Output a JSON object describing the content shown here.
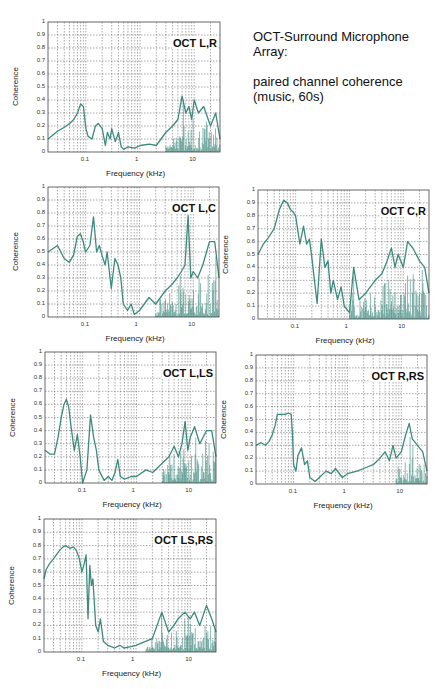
{
  "page": {
    "title_lines": [
      "OCT-Surround Microphone",
      "Array:"
    ],
    "subtitle_lines": [
      "paired channel coherence",
      "(music, 60s)"
    ],
    "page_number": ""
  },
  "colors": {
    "trace": "#3d8a7e",
    "grid": "#555555",
    "axis": "#444444"
  },
  "chart_data": [
    {
      "type": "line",
      "title": "OCT L,R",
      "xlabel": "Frequency (kHz)",
      "ylabel": "Coherence",
      "xscale": "log",
      "xlim": [
        0.02,
        30
      ],
      "ylim": [
        0,
        1
      ],
      "x_ticks": [
        "0.1",
        "1",
        "10"
      ],
      "y_ticks": [
        "0",
        "0.1",
        "0.2",
        "0.3",
        "0.4",
        "0.5",
        "0.6",
        "0.7",
        "0.8",
        "0.9",
        "1"
      ],
      "grid": true,
      "x": [
        0.02,
        0.03,
        0.04,
        0.05,
        0.06,
        0.07,
        0.08,
        0.09,
        0.1,
        0.11,
        0.13,
        0.15,
        0.17,
        0.2,
        0.23,
        0.25,
        0.28,
        0.3,
        0.35,
        0.4,
        0.45,
        0.5,
        0.6,
        0.8,
        1,
        1.5,
        2,
        3,
        4,
        5,
        6,
        7,
        8,
        9,
        10,
        12,
        15,
        20,
        25,
        30
      ],
      "y": [
        0.1,
        0.16,
        0.19,
        0.22,
        0.25,
        0.3,
        0.37,
        0.35,
        0.18,
        0.12,
        0.1,
        0.2,
        0.22,
        0.18,
        0.05,
        0.15,
        0.1,
        0.18,
        0.08,
        0.15,
        0.04,
        0.02,
        0.04,
        0.03,
        0.05,
        0.06,
        0.05,
        0.15,
        0.2,
        0.25,
        0.43,
        0.3,
        0.35,
        0.25,
        0.4,
        0.3,
        0.35,
        0.2,
        0.3,
        0.1
      ],
      "noise_floor": 0.05,
      "noise_band_from": 3
    },
    {
      "type": "line",
      "title": "OCT L,C",
      "xlabel": "Frequency (kHz)",
      "ylabel": "Coherence",
      "xscale": "log",
      "xlim": [
        0.02,
        30
      ],
      "ylim": [
        0,
        1
      ],
      "x_ticks": [
        "0.1",
        "1",
        "10"
      ],
      "y_ticks": [
        "0",
        "0.1",
        "0.2",
        "0.3",
        "0.4",
        "0.5",
        "0.6",
        "0.7",
        "0.8",
        "0.9",
        "1"
      ],
      "grid": true,
      "x": [
        0.02,
        0.03,
        0.04,
        0.05,
        0.06,
        0.07,
        0.08,
        0.09,
        0.1,
        0.12,
        0.14,
        0.16,
        0.18,
        0.2,
        0.23,
        0.25,
        0.3,
        0.35,
        0.4,
        0.45,
        0.5,
        0.6,
        0.7,
        0.8,
        1,
        1.5,
        2,
        3,
        4,
        5,
        6,
        7,
        8,
        9,
        10,
        12,
        15,
        20,
        25,
        30
      ],
      "y": [
        0.5,
        0.55,
        0.45,
        0.42,
        0.48,
        0.62,
        0.64,
        0.58,
        0.5,
        0.55,
        0.77,
        0.5,
        0.55,
        0.48,
        0.4,
        0.5,
        0.22,
        0.45,
        0.4,
        0.3,
        0.1,
        0.05,
        0.1,
        0.02,
        0.05,
        0.15,
        0.1,
        0.2,
        0.25,
        0.3,
        0.35,
        0.4,
        0.78,
        0.3,
        0.35,
        0.3,
        0.4,
        0.58,
        0.58,
        0.3
      ],
      "noise_floor": 0.08,
      "noise_band_from": 2
    },
    {
      "type": "line",
      "title": "OCT C,R",
      "xlabel": "Frequency (kHz)",
      "ylabel": "Coherence",
      "xscale": "log",
      "xlim": [
        0.02,
        30
      ],
      "ylim": [
        0,
        1
      ],
      "x_ticks": [
        "0.1",
        "1",
        "10"
      ],
      "y_ticks": [
        "0",
        "0.1",
        "0.2",
        "0.3",
        "0.4",
        "0.5",
        "0.6",
        "0.7",
        "0.8",
        "0.9",
        "1"
      ],
      "grid": true,
      "x": [
        0.02,
        0.025,
        0.03,
        0.04,
        0.05,
        0.06,
        0.07,
        0.08,
        0.09,
        0.1,
        0.12,
        0.14,
        0.16,
        0.18,
        0.2,
        0.25,
        0.3,
        0.35,
        0.4,
        0.45,
        0.5,
        0.6,
        0.7,
        0.8,
        1,
        1.2,
        1.5,
        2,
        3,
        4,
        5,
        6,
        7,
        8,
        9,
        10,
        12,
        15,
        20,
        25,
        30
      ],
      "y": [
        0.5,
        0.58,
        0.62,
        0.7,
        0.85,
        0.92,
        0.9,
        0.85,
        0.83,
        0.8,
        0.58,
        0.72,
        0.58,
        0.62,
        0.48,
        0.12,
        0.62,
        0.4,
        0.45,
        0.2,
        0.3,
        0.15,
        0.25,
        0.1,
        0.05,
        0.4,
        0.15,
        0.2,
        0.3,
        0.35,
        0.45,
        0.55,
        0.4,
        0.5,
        0.45,
        0.4,
        0.6,
        0.55,
        0.45,
        0.4,
        0.2
      ],
      "noise_floor": 0.08,
      "noise_band_from": 1
    },
    {
      "type": "line",
      "title": "OCT L,LS",
      "xlabel": "Frequency (kHz)",
      "ylabel": "Coherence",
      "xscale": "log",
      "xlim": [
        0.02,
        30
      ],
      "ylim": [
        0,
        1
      ],
      "x_ticks": [
        "0.1",
        "1",
        "10"
      ],
      "y_ticks": [
        "0",
        "0.1",
        "0.2",
        "0.3",
        "0.4",
        "0.5",
        "0.6",
        "0.7",
        "0.8",
        "0.9",
        "1"
      ],
      "grid": true,
      "x": [
        0.02,
        0.025,
        0.03,
        0.035,
        0.04,
        0.045,
        0.05,
        0.055,
        0.06,
        0.07,
        0.08,
        0.09,
        0.1,
        0.12,
        0.14,
        0.16,
        0.18,
        0.2,
        0.25,
        0.3,
        0.35,
        0.4,
        0.45,
        0.5,
        0.6,
        0.8,
        1,
        1.5,
        2,
        3,
        4,
        5,
        6,
        7,
        8,
        9,
        10,
        12,
        15,
        20,
        25,
        30
      ],
      "y": [
        0.25,
        0.22,
        0.22,
        0.35,
        0.5,
        0.6,
        0.64,
        0.58,
        0.45,
        0.25,
        0.37,
        0.2,
        0.0,
        0.1,
        0.52,
        0.35,
        0.25,
        0.1,
        0.02,
        0.05,
        0.02,
        0.08,
        0.18,
        0.05,
        0.03,
        0.05,
        0.05,
        0.1,
        0.08,
        0.15,
        0.2,
        0.28,
        0.2,
        0.3,
        0.47,
        0.25,
        0.35,
        0.43,
        0.3,
        0.4,
        0.4,
        0.2
      ],
      "noise_floor": 0.05,
      "noise_band_from": 3
    },
    {
      "type": "line",
      "title": "OCT R,RS",
      "xlabel": "Frequency (kHz)",
      "ylabel": "Coherence",
      "xscale": "log",
      "xlim": [
        0.02,
        30
      ],
      "ylim": [
        0,
        1
      ],
      "x_ticks": [
        "0.1",
        "1",
        "10"
      ],
      "y_ticks": [
        "0",
        "0.1",
        "0.2",
        "0.3",
        "0.4",
        "0.5",
        "0.6",
        "0.7",
        "0.8",
        "0.9",
        "1"
      ],
      "grid": true,
      "x": [
        0.02,
        0.025,
        0.03,
        0.035,
        0.04,
        0.045,
        0.05,
        0.06,
        0.07,
        0.08,
        0.09,
        0.095,
        0.1,
        0.11,
        0.12,
        0.14,
        0.16,
        0.18,
        0.2,
        0.25,
        0.3,
        0.4,
        0.5,
        0.6,
        0.8,
        1,
        1.5,
        2,
        3,
        4,
        5,
        6,
        7,
        8,
        10,
        12,
        14,
        16,
        20,
        25,
        30
      ],
      "y": [
        0.3,
        0.32,
        0.3,
        0.33,
        0.38,
        0.45,
        0.54,
        0.54,
        0.54,
        0.55,
        0.54,
        0.4,
        0.15,
        0.1,
        0.22,
        0.28,
        0.15,
        0.18,
        0.05,
        0.02,
        0.05,
        0.1,
        0.08,
        0.12,
        0.05,
        0.08,
        0.1,
        0.12,
        0.15,
        0.2,
        0.25,
        0.18,
        0.3,
        0.2,
        0.25,
        0.38,
        0.47,
        0.35,
        0.3,
        0.25,
        0.1
      ],
      "noise_floor": 0.05,
      "noise_band_from": 8
    },
    {
      "type": "line",
      "title": "OCT LS,RS",
      "xlabel": "Frequency (kHz)",
      "ylabel": "Coherence",
      "xscale": "log",
      "xlim": [
        0.02,
        30
      ],
      "ylim": [
        0,
        1
      ],
      "x_ticks": [
        "0.1",
        "1",
        "10"
      ],
      "y_ticks": [
        "0",
        "0.1",
        "0.2",
        "0.3",
        "0.4",
        "0.5",
        "0.6",
        "0.7",
        "0.8",
        "0.9",
        "1"
      ],
      "grid": true,
      "x": [
        0.02,
        0.022,
        0.025,
        0.03,
        0.035,
        0.04,
        0.045,
        0.05,
        0.06,
        0.07,
        0.08,
        0.09,
        0.1,
        0.11,
        0.12,
        0.13,
        0.14,
        0.15,
        0.16,
        0.18,
        0.2,
        0.22,
        0.25,
        0.3,
        0.35,
        0.4,
        0.5,
        0.6,
        0.8,
        1,
        1.5,
        2,
        3,
        4,
        5,
        6,
        8,
        10,
        12,
        15,
        20,
        25,
        30
      ],
      "y": [
        0.55,
        0.62,
        0.66,
        0.7,
        0.74,
        0.77,
        0.79,
        0.8,
        0.78,
        0.79,
        0.76,
        0.7,
        0.6,
        0.66,
        0.73,
        0.25,
        0.65,
        0.5,
        0.55,
        0.2,
        0.15,
        0.25,
        0.08,
        0.05,
        0.04,
        0.03,
        0.05,
        0.03,
        0.04,
        0.05,
        0.08,
        0.1,
        0.3,
        0.15,
        0.2,
        0.25,
        0.3,
        0.25,
        0.3,
        0.2,
        0.35,
        0.25,
        0.15
      ],
      "noise_floor": 0.05,
      "noise_band_from": 1.5
    }
  ],
  "layout": {
    "plots": [
      {
        "left": 48,
        "top": 22,
        "width": 172,
        "height": 130
      },
      {
        "left": 48,
        "top": 187,
        "width": 171,
        "height": 130
      },
      {
        "left": 258,
        "top": 190,
        "width": 171,
        "height": 129
      },
      {
        "left": 45,
        "top": 352,
        "width": 171,
        "height": 131
      },
      {
        "left": 256,
        "top": 355,
        "width": 171,
        "height": 129
      },
      {
        "left": 44,
        "top": 519,
        "width": 172,
        "height": 133
      }
    ]
  }
}
